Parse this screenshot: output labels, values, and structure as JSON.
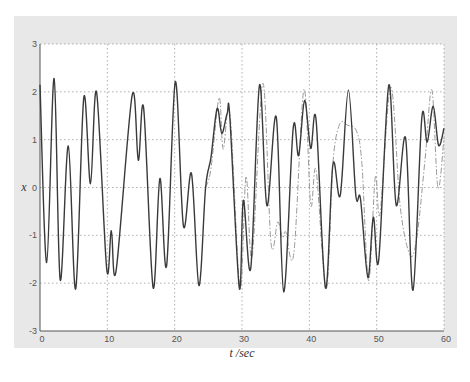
{
  "chart_data": {
    "type": "line",
    "title": "",
    "xlabel": "t /sec",
    "ylabel": "x",
    "xlim": [
      0,
      60
    ],
    "ylim": [
      -3,
      3
    ],
    "xticks": [
      0,
      10,
      20,
      30,
      40,
      50,
      60
    ],
    "yticks": [
      -3,
      -2,
      -1,
      0,
      1,
      2,
      3
    ],
    "xtick_labels": [
      "0",
      "10",
      "20",
      "30",
      "40",
      "50",
      "60"
    ],
    "ytick_labels": [
      "-3",
      "-2",
      "-1",
      "0",
      "1",
      "2",
      "3"
    ],
    "grid": true,
    "legend": null,
    "series": [
      {
        "name": "solid",
        "style": "solid",
        "color": "#3a3a3a",
        "points": [
          [
            0,
            2.15
          ],
          [
            1.0,
            -1.57
          ],
          [
            2.1,
            2.28
          ],
          [
            3.0,
            -1.93
          ],
          [
            4.2,
            0.87
          ],
          [
            5.3,
            -2.12
          ],
          [
            6.5,
            1.88
          ],
          [
            7.5,
            0.08
          ],
          [
            8.4,
            1.99
          ],
          [
            9.9,
            -1.7
          ],
          [
            10.6,
            -0.9
          ],
          [
            11.3,
            -1.74
          ],
          [
            13.7,
            1.93
          ],
          [
            14.6,
            0.57
          ],
          [
            15.4,
            1.65
          ],
          [
            16.8,
            -2.09
          ],
          [
            17.8,
            0.19
          ],
          [
            18.8,
            -1.64
          ],
          [
            20.1,
            2.21
          ],
          [
            21.3,
            -0.8
          ],
          [
            22.5,
            0.29
          ],
          [
            23.6,
            -2.05
          ],
          [
            24.6,
            0.0
          ],
          [
            25.4,
            0.63
          ],
          [
            26.3,
            1.65
          ],
          [
            27.0,
            1.13
          ],
          [
            27.8,
            1.55
          ],
          [
            28.2,
            1.45
          ],
          [
            29.6,
            -2.1
          ],
          [
            30.2,
            -0.27
          ],
          [
            31.3,
            -1.68
          ],
          [
            32.6,
            2.14
          ],
          [
            33.7,
            -0.38
          ],
          [
            35.1,
            1.47
          ],
          [
            36.2,
            -2.18
          ],
          [
            37.6,
            1.24
          ],
          [
            38.4,
            0.67
          ],
          [
            39.3,
            1.82
          ],
          [
            40.2,
            0.82
          ],
          [
            41.0,
            1.41
          ],
          [
            42.4,
            -2.1
          ],
          [
            43.5,
            0.48
          ],
          [
            44.6,
            -0.16
          ],
          [
            45.8,
            2.04
          ],
          [
            46.9,
            -0.16
          ],
          [
            47.6,
            -0.24
          ],
          [
            48.7,
            -1.88
          ],
          [
            49.5,
            -0.62
          ],
          [
            50.3,
            -1.52
          ],
          [
            51.8,
            2.14
          ],
          [
            52.9,
            -0.37
          ],
          [
            54.3,
            1.03
          ],
          [
            55.4,
            -2.15
          ],
          [
            56.7,
            1.45
          ],
          [
            57.5,
            0.95
          ],
          [
            58.4,
            1.7
          ],
          [
            59.2,
            0.88
          ],
          [
            60,
            1.24
          ]
        ]
      },
      {
        "name": "dash-dot",
        "style": "dashdot",
        "color": "#9a9a9a",
        "points": [
          [
            24.6,
            0.0
          ],
          [
            25.4,
            0.4
          ],
          [
            26.6,
            1.88
          ],
          [
            27.2,
            0.8
          ],
          [
            28.2,
            1.55
          ],
          [
            29.7,
            -2.1
          ],
          [
            30.6,
            0.23
          ],
          [
            31.5,
            -1.46
          ],
          [
            33.1,
            2.18
          ],
          [
            34.3,
            -1.16
          ],
          [
            35.3,
            -0.72
          ],
          [
            36.0,
            -1.05
          ],
          [
            36.5,
            -0.93
          ],
          [
            37.7,
            -1.38
          ],
          [
            39.2,
            2.05
          ],
          [
            40.2,
            -0.36
          ],
          [
            41.0,
            0.36
          ],
          [
            42.5,
            -2.12
          ],
          [
            43.5,
            0.5
          ],
          [
            44.5,
            1.32
          ],
          [
            45.7,
            1.3
          ],
          [
            47.0,
            1.18
          ],
          [
            47.8,
            0.5
          ],
          [
            48.8,
            -1.95
          ],
          [
            49.8,
            0.22
          ],
          [
            50.5,
            -0.55
          ],
          [
            52.1,
            2.1
          ],
          [
            53.5,
            -0.4
          ],
          [
            55.0,
            -1.42
          ],
          [
            56.0,
            -1.0
          ],
          [
            57.2,
            0.6
          ],
          [
            58.2,
            2.04
          ],
          [
            59.1,
            0.0
          ],
          [
            60,
            1.05
          ]
        ]
      }
    ]
  },
  "caption": "Fig. ... comparison of x(t)"
}
